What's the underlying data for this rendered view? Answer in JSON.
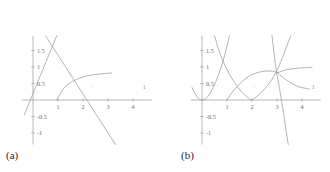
{
  "figure": {
    "panels": [
      {
        "id": "a",
        "label": "(a)",
        "chart_data": {
          "type": "line",
          "title": "",
          "xlabel": "",
          "ylabel": "",
          "xlim": [
            -0.45,
            4.75
          ],
          "ylim": [
            -1.35,
            1.95
          ],
          "grid": false,
          "legend": "none",
          "xticks": [
            1,
            2,
            3,
            4
          ],
          "xticklabels": [
            "1",
            "2",
            "3",
            "4"
          ],
          "yticks": [
            1.5,
            1,
            0.5,
            -0.5,
            -1
          ],
          "yticklabels": [
            "1.5",
            "1",
            "0.5",
            "-0.5",
            "-1"
          ],
          "series": [
            {
              "name": "rising-line",
              "kind": "line",
              "points": [
                [
                  -0.35,
                  -0.45
                ],
                [
                  0.95,
                  1.95
                ]
              ]
            },
            {
              "name": "falling-line",
              "kind": "line",
              "points": [
                [
                  0.5,
                  1.95
                ],
                [
                  3.3,
                  -1.35
                ]
              ]
            },
            {
              "name": "arc-curve",
              "kind": "curve",
              "points": [
                [
                  0.95,
                  0.0
                ],
                [
                  1.25,
                  0.37
                ],
                [
                  1.6,
                  0.57
                ],
                [
                  2.1,
                  0.72
                ],
                [
                  2.7,
                  0.79
                ],
                [
                  3.15,
                  0.82
                ]
              ]
            }
          ],
          "annotations": [
            {
              "name": "dot-marker",
              "text": "·",
              "x": 2.35,
              "y": 0.33
            },
            {
              "name": "tick-marker",
              "text": "1",
              "x": 4.45,
              "y": 0.32
            }
          ]
        }
      },
      {
        "id": "b",
        "label": "(b)",
        "chart_data": {
          "type": "line",
          "title": "",
          "xlabel": "",
          "ylabel": "",
          "xlim": [
            -0.45,
            4.75
          ],
          "ylim": [
            -1.35,
            1.95
          ],
          "grid": false,
          "legend": "none",
          "xticks": [
            1,
            2,
            3,
            4
          ],
          "xticklabels": [
            "1",
            "2",
            "3",
            "4"
          ],
          "yticks": [
            1.5,
            1,
            0.5,
            -0.5,
            -1
          ],
          "yticklabels": [
            "1.5",
            "1",
            "0.5",
            "-0.5",
            "-1"
          ],
          "series": [
            {
              "name": "left-parabola",
              "kind": "curve",
              "points": [
                [
                  -0.4,
                  0.38
                ],
                [
                  -0.2,
                  0.1
                ],
                [
                  0.0,
                  0.0
                ],
                [
                  0.25,
                  0.12
                ],
                [
                  0.55,
                  0.55
                ],
                [
                  0.85,
                  1.2
                ],
                [
                  1.1,
                  1.95
                ]
              ]
            },
            {
              "name": "descending-curve",
              "kind": "curve",
              "points": [
                [
                  0.5,
                  1.95
                ],
                [
                  0.75,
                  1.35
                ],
                [
                  1.1,
                  0.78
                ],
                [
                  1.5,
                  0.32
                ],
                [
                  1.85,
                  0.06
                ],
                [
                  2.0,
                  0.0
                ]
              ]
            },
            {
              "name": "mid-parabola",
              "kind": "curve",
              "points": [
                [
                  1.0,
                  0.0
                ],
                [
                  1.3,
                  0.32
                ],
                [
                  1.7,
                  0.62
                ],
                [
                  2.1,
                  0.8
                ],
                [
                  2.6,
                  0.88
                ],
                [
                  3.05,
                  0.84
                ]
              ]
            },
            {
              "name": "right-rising-curve",
              "kind": "curve",
              "points": [
                [
                  2.0,
                  0.0
                ],
                [
                  2.3,
                  0.18
                ],
                [
                  2.7,
                  0.52
                ],
                [
                  3.0,
                  0.9
                ],
                [
                  3.3,
                  1.45
                ],
                [
                  3.55,
                  1.95
                ]
              ]
            },
            {
              "name": "steep-descending-line",
              "kind": "curve",
              "points": [
                [
                  2.8,
                  1.95
                ],
                [
                  2.95,
                  1.0
                ],
                [
                  3.1,
                  0.35
                ],
                [
                  3.25,
                  -0.35
                ],
                [
                  3.45,
                  -1.35
                ]
              ]
            },
            {
              "name": "upper-right-curve",
              "kind": "curve",
              "points": [
                [
                  3.0,
                  0.82
                ],
                [
                  3.4,
                  0.92
                ],
                [
                  3.9,
                  0.97
                ],
                [
                  4.4,
                  0.99
                ]
              ]
            },
            {
              "name": "lower-right-curve",
              "kind": "curve",
              "points": [
                [
                  3.05,
                  0.8
                ],
                [
                  3.35,
                  0.62
                ],
                [
                  3.8,
                  0.42
                ],
                [
                  4.3,
                  0.33
                ]
              ]
            }
          ],
          "annotations": [
            {
              "name": "dot-marker",
              "text": "·",
              "x": 2.1,
              "y": 0.33
            },
            {
              "name": "tick-marker",
              "text": "1",
              "x": 4.45,
              "y": 0.32
            }
          ]
        }
      }
    ]
  },
  "colors": {
    "axis": "#9a9a9a",
    "curve": "#8c8c8c",
    "tick_text": "#6b6b6b",
    "label_text": "#2a2a2a",
    "background": "#ffffff"
  }
}
